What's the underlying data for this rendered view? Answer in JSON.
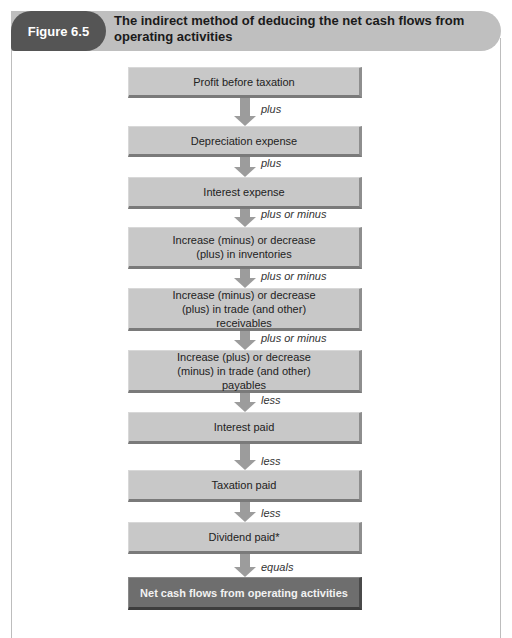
{
  "figure": {
    "label": "Figure 6.5",
    "title": "The indirect method of deducing the net cash flows from operating activities"
  },
  "colors": {
    "title_bar": "#bfbfbf",
    "figure_pill": "#555555",
    "box": "#c8c8c8",
    "final_box": "#6e6e6e",
    "arrow": "#9c9c9c"
  },
  "flow": {
    "steps": [
      {
        "label": "Profit before taxation"
      },
      {
        "label": "Depreciation expense"
      },
      {
        "label": "Interest expense"
      },
      {
        "label": "Increase (minus) or decrease (plus) in inventories"
      },
      {
        "label": "Increase (minus) or decrease (plus) in trade (and other) receivables"
      },
      {
        "label": "Increase (plus) or decrease (minus) in trade (and other) payables"
      },
      {
        "label": "Interest paid"
      },
      {
        "label": "Taxation paid"
      },
      {
        "label": "Dividend paid*"
      },
      {
        "label": "Net cash flows from operating activities"
      }
    ],
    "connectors": [
      {
        "label": "plus"
      },
      {
        "label": "plus"
      },
      {
        "label": "plus or minus"
      },
      {
        "label": "plus or minus"
      },
      {
        "label": "plus or minus"
      },
      {
        "label": "less"
      },
      {
        "label": "less"
      },
      {
        "label": "less"
      },
      {
        "label": "equals"
      }
    ]
  }
}
